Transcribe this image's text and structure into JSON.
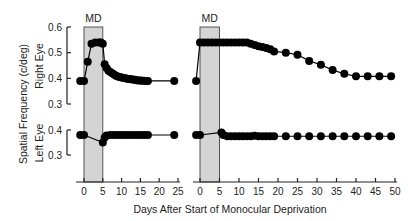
{
  "chart_data": {
    "type": "line",
    "title": "",
    "xlabel": "Days After Start of Monocular Deprivation",
    "ylabel": "Spatial Frequency (c/deg)",
    "row_labels": [
      "Right Eye",
      "Left Eye"
    ],
    "shade_label": "MD",
    "colors": {
      "shade": "#d4d4d4",
      "line": "#000000",
      "point": "#000000",
      "axis": "#222222"
    },
    "grid": false,
    "right_eye_axis": {
      "ylim": [
        0.3,
        0.6
      ],
      "ticks": [
        0.3,
        0.4,
        0.5,
        0.6
      ],
      "tick_labels": [
        "0.3",
        "0.4",
        "0.5",
        "0.6"
      ]
    },
    "left_eye_axis": {
      "ylim": [
        0.3,
        0.4
      ],
      "ticks": [
        0.3,
        0.4
      ],
      "tick_labels": [
        "0.3",
        "0.4"
      ]
    },
    "panels": [
      {
        "name": "short-deprivation",
        "shade_range": [
          0,
          5
        ],
        "xlim": [
          -1,
          25
        ],
        "xticks": [
          0,
          5,
          10,
          15,
          20,
          25
        ],
        "xtick_labels": [
          "0",
          "5",
          "10",
          "15",
          "20",
          "25"
        ],
        "series": [
          {
            "name": "Right Eye",
            "x": [
              -1,
              0,
              1,
              2,
              3,
              4,
              4.5,
              5,
              5.5,
              6,
              6.5,
              7,
              7.5,
              8,
              8.5,
              9,
              9.5,
              10,
              10.5,
              11,
              11.5,
              12,
              12.5,
              13,
              13.5,
              14,
              14.5,
              15,
              15.5,
              16,
              16.5,
              17,
              24
            ],
            "y": [
              0.39,
              0.39,
              0.465,
              0.535,
              0.54,
              0.54,
              0.54,
              0.535,
              0.455,
              0.44,
              0.43,
              0.425,
              0.42,
              0.415,
              0.41,
              0.407,
              0.405,
              0.403,
              0.401,
              0.4,
              0.398,
              0.397,
              0.396,
              0.395,
              0.394,
              0.393,
              0.392,
              0.392,
              0.391,
              0.391,
              0.39,
              0.39,
              0.39
            ]
          },
          {
            "name": "Left Eye",
            "x": [
              -1,
              0,
              5,
              5.5,
              6,
              7,
              8,
              9,
              10,
              11,
              12,
              13,
              14,
              15,
              16,
              17,
              24
            ],
            "y": [
              0.38,
              0.38,
              0.35,
              0.37,
              0.378,
              0.38,
              0.38,
              0.38,
              0.38,
              0.38,
              0.38,
              0.38,
              0.38,
              0.38,
              0.38,
              0.38,
              0.38
            ]
          }
        ]
      },
      {
        "name": "long-deprivation",
        "shade_range": [
          0,
          5
        ],
        "xlim": [
          -1,
          50
        ],
        "xticks": [
          0,
          5,
          10,
          15,
          20,
          25,
          30,
          35,
          40,
          45,
          50
        ],
        "xtick_labels": [
          "0",
          "5",
          "10",
          "15",
          "20",
          "25",
          "30",
          "35",
          "40",
          "45",
          "50"
        ],
        "series": [
          {
            "name": "Right Eye",
            "x": [
              -1,
              0,
              1,
              2,
              3,
              4,
              5,
              6,
              7,
              8,
              9,
              10,
              11,
              12,
              13,
              14,
              15,
              16,
              17,
              18,
              19,
              22,
              25,
              28,
              31,
              34,
              37,
              40,
              43,
              46,
              49
            ],
            "y": [
              0.39,
              0.54,
              0.54,
              0.54,
              0.54,
              0.54,
              0.54,
              0.54,
              0.54,
              0.54,
              0.54,
              0.54,
              0.54,
              0.54,
              0.535,
              0.53,
              0.525,
              0.522,
              0.518,
              0.513,
              0.505,
              0.5,
              0.492,
              0.468,
              0.453,
              0.432,
              0.418,
              0.408,
              0.408,
              0.408,
              0.408
            ]
          },
          {
            "name": "Left Eye",
            "x": [
              -1,
              0,
              5.5,
              6,
              7,
              8,
              9,
              10,
              11,
              12,
              13,
              14,
              15,
              16,
              17,
              18,
              19,
              22,
              25,
              28,
              31,
              34,
              37,
              40,
              43,
              46,
              49
            ],
            "y": [
              0.38,
              0.38,
              0.39,
              0.38,
              0.375,
              0.375,
              0.375,
              0.375,
              0.375,
              0.375,
              0.375,
              0.377,
              0.375,
              0.375,
              0.375,
              0.375,
              0.375,
              0.375,
              0.375,
              0.375,
              0.375,
              0.375,
              0.375,
              0.375,
              0.375,
              0.375,
              0.375
            ]
          }
        ]
      }
    ]
  }
}
